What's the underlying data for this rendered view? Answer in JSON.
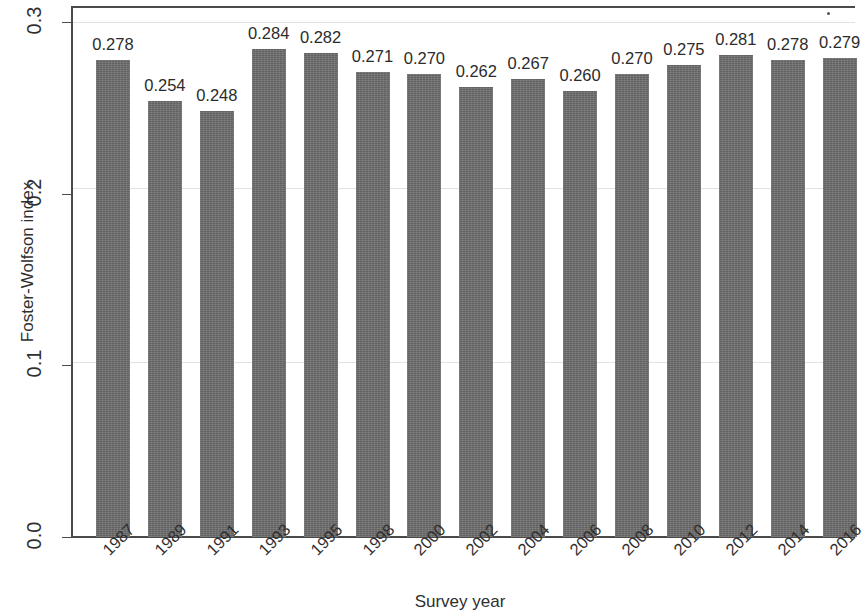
{
  "chart_data": {
    "type": "bar",
    "title": "",
    "xlabel": "Survey year",
    "ylabel": "Foster-Wolfson index",
    "categories": [
      "1987",
      "1989",
      "1991",
      "1993",
      "1995",
      "1998",
      "2000",
      "2002",
      "2004",
      "2006",
      "2008",
      "2010",
      "2012",
      "2014",
      "2016"
    ],
    "values": [
      0.278,
      0.254,
      0.248,
      0.284,
      0.282,
      0.271,
      0.27,
      0.262,
      0.267,
      0.26,
      0.27,
      0.275,
      0.281,
      0.278,
      0.279
    ],
    "value_labels": [
      "0.278",
      "0.254",
      "0.248",
      "0.284",
      "0.282",
      "0.271",
      "0.270",
      "0.262",
      "0.267",
      "0.260",
      "0.270",
      "0.275",
      "0.281",
      "0.278",
      "0.279"
    ],
    "ylim": [
      0.0,
      0.3
    ],
    "yticks": [
      0.0,
      0.1,
      0.2,
      0.3
    ],
    "ytick_labels": [
      "0.0",
      "0.1",
      "0.2",
      "0.3"
    ],
    "grid": true,
    "legend": "none",
    "bar_color": "#6b6b6b",
    "axis_color": "#4a4a4a",
    "text_color": "#2f2f2f"
  }
}
